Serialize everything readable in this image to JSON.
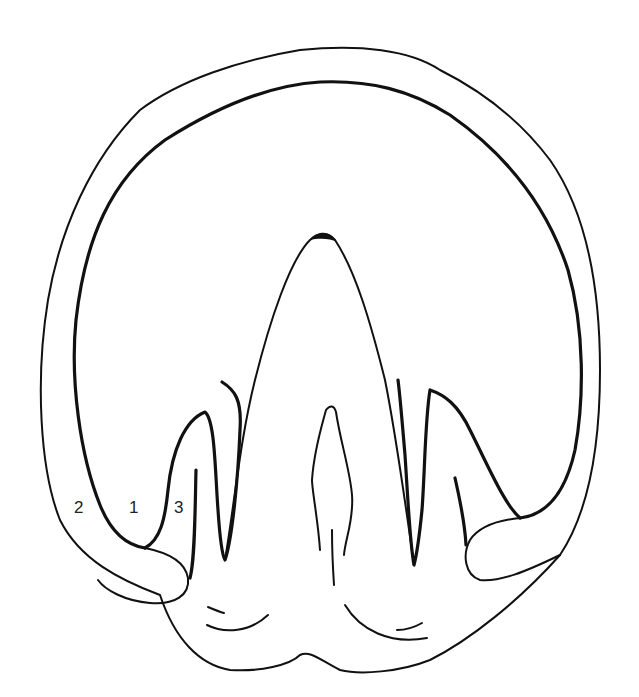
{
  "diagram": {
    "labels": [
      {
        "id": "label-2",
        "text": "2",
        "x": 74,
        "y": 498
      },
      {
        "id": "label-1",
        "text": "1",
        "x": 129,
        "y": 498
      },
      {
        "id": "label-3",
        "text": "3",
        "x": 174,
        "y": 498
      }
    ],
    "colors": {
      "line": "#111111",
      "background": "#ffffff"
    }
  }
}
